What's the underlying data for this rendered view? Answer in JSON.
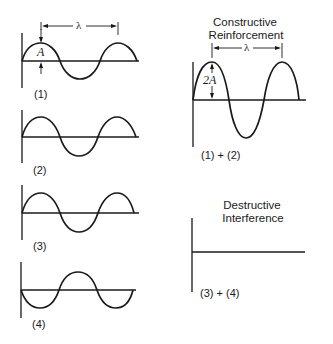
{
  "figure": {
    "left_panels": [
      {
        "label": "(1)",
        "amplitude_label": "A",
        "wavelength_label": "λ",
        "phase": "starts upward"
      },
      {
        "label": "(2)",
        "phase": "starts upward (in phase with 1)"
      },
      {
        "label": "(3)",
        "phase": "starts upward"
      },
      {
        "label": "(4)",
        "phase": "starts downward (180° out of phase with 3)"
      }
    ],
    "constructive": {
      "title_line1": "Constructive",
      "title_line2": "Reinforcement",
      "amplitude_label": "2A",
      "wavelength_label": "λ",
      "label": "(1) + (2)"
    },
    "destructive": {
      "title_line1": "Destructive",
      "title_line2": "Interference",
      "label": "(3) + (4)"
    }
  },
  "colors": {
    "ink": "#1a1a1a",
    "background": "#ffffff"
  }
}
